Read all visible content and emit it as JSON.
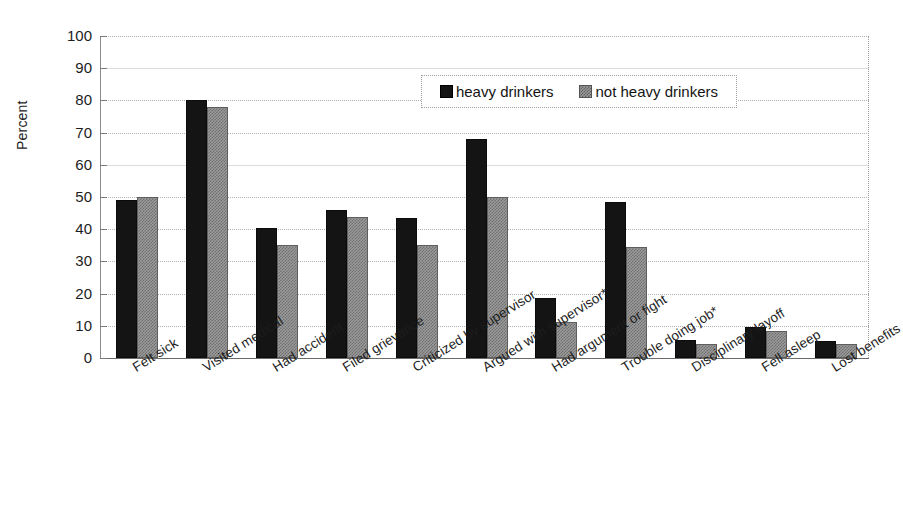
{
  "chart_data": {
    "type": "bar",
    "title": "",
    "xlabel": "",
    "ylabel": "Percent",
    "ylim": [
      0,
      100
    ],
    "yticks": [
      0,
      10,
      20,
      30,
      40,
      50,
      60,
      70,
      80,
      90,
      100
    ],
    "grid": true,
    "legend_position": "top-right-inside",
    "categories": [
      "Felt sick",
      "Visited medical",
      "Had accident",
      "Filed grievance",
      "Criticized by supervisor",
      "Argued with supervisor*",
      "Had argument or fight",
      "Trouble doing job*",
      "Disciplinary layoff",
      "Fell asleep",
      "Lost benefits"
    ],
    "series": [
      {
        "name": "heavy drinkers",
        "color": "#141414",
        "values": [
          49,
          80,
          40.5,
          46,
          43.5,
          68,
          18.5,
          48.5,
          5.5,
          9.5,
          5.2
        ]
      },
      {
        "name": "not heavy drinkers",
        "color": "#9b9b9b",
        "values": [
          50,
          78,
          35,
          43.8,
          35,
          50,
          11.2,
          34.5,
          4.5,
          8.3,
          4.2
        ]
      }
    ]
  },
  "axis": {
    "y_title": "Percent",
    "y_tick_labels": [
      "100",
      "90",
      "80",
      "70",
      "60",
      "50",
      "40",
      "30",
      "20",
      "10",
      "0"
    ]
  },
  "legend": {
    "items": [
      {
        "label": "heavy drinkers",
        "swatch": "solid-black-swatch"
      },
      {
        "label": "not heavy drinkers",
        "swatch": "hatched-gray-swatch"
      }
    ]
  }
}
